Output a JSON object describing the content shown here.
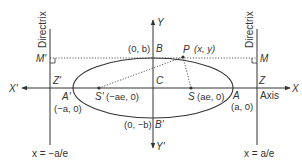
{
  "diagram": {
    "type": "ellipse-with-directrices",
    "colors": {
      "stroke": "#333333",
      "background": "#ffffff"
    },
    "axes": {
      "x_pos_label": "X",
      "x_neg_label": "X'",
      "y_pos_label": "Y",
      "y_neg_label": "Y'",
      "axis_label": "Axis"
    },
    "directrix": {
      "left_title": "Directrix",
      "right_title": "Directrix",
      "left_equation": "x = −a/e",
      "right_equation": "x = a/e"
    },
    "points": {
      "P": {
        "name": "P",
        "coord": "(x, y)"
      },
      "B": {
        "name": "B",
        "coord": "(0, b)"
      },
      "B_prime": {
        "name": "B'",
        "coord": "(0, −b)"
      },
      "A": {
        "name": "A",
        "coord": "(a, 0)"
      },
      "A_prime": {
        "name": "A'",
        "coord": "(−a, 0)"
      },
      "S": {
        "name": "S",
        "coord": "(ae, 0)"
      },
      "S_prime": {
        "name": "S'",
        "coord": "(−ae, 0)"
      },
      "C": {
        "name": "C"
      },
      "M": {
        "name": "M"
      },
      "M_prime": {
        "name": "M'"
      },
      "Z": {
        "name": "Z"
      },
      "Z_prime": {
        "name": "Z'"
      }
    }
  }
}
